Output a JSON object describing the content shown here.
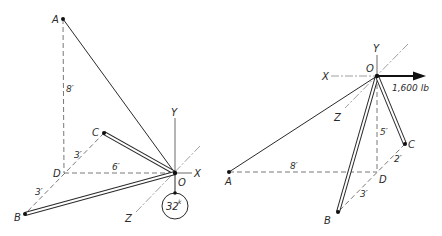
{
  "left_figure": {
    "points": {
      "A": {
        "label": "A",
        "x": 63,
        "y": 19
      },
      "B": {
        "label": "B",
        "x": 25,
        "y": 214
      },
      "C": {
        "label": "C",
        "x": 104,
        "y": 133
      },
      "D": {
        "label": "D",
        "x": 64,
        "y": 173
      },
      "O": {
        "label": "O",
        "x": 175,
        "y": 173
      }
    },
    "axes": {
      "x": "X",
      "y": "Y",
      "z": "Z"
    },
    "dimensions": {
      "AD": "8′",
      "DC": "3′",
      "DB": "3′",
      "DO": "6′"
    },
    "load": {
      "value": "32",
      "unit": "k"
    }
  },
  "right_figure": {
    "points": {
      "A": {
        "label": "A",
        "x": 229,
        "y": 172
      },
      "B": {
        "label": "B",
        "x": 338,
        "y": 212
      },
      "C": {
        "label": "C",
        "x": 405,
        "y": 144
      },
      "D": {
        "label": "D",
        "x": 377,
        "y": 172
      },
      "O": {
        "label": "O",
        "x": 377,
        "y": 76
      }
    },
    "axes": {
      "x": "X",
      "y": "Y",
      "z": "Z"
    },
    "dimensions": {
      "AD": "8′",
      "OD": "5′",
      "DC": "2′",
      "DB": "3′"
    },
    "load": {
      "value": "1,600 lb"
    }
  }
}
